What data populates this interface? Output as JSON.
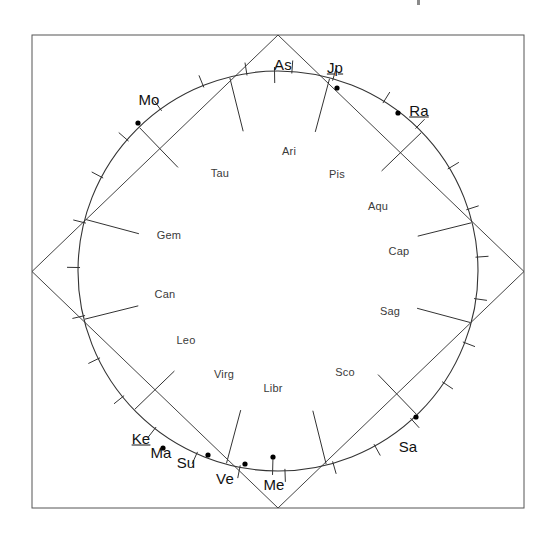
{
  "chart_data": {
    "type": "scatter",
    "title": "",
    "subtitle": "",
    "layout": {
      "frame": {
        "x": 32,
        "y": 35,
        "width": 492,
        "height": 473
      },
      "circle_center": {
        "x": 278,
        "y": 271
      },
      "circle_radius": 200,
      "grid": false,
      "legend": false,
      "axis_ranges": {
        "angle_degrees": [
          0,
          360
        ]
      }
    },
    "zodiac_signs": [
      {
        "label": "Ari",
        "x": 289,
        "y": 151
      },
      {
        "label": "Tau",
        "x": 220,
        "y": 173
      },
      {
        "label": "Gem",
        "x": 169,
        "y": 235
      },
      {
        "label": "Can",
        "x": 165,
        "y": 294
      },
      {
        "label": "Leo",
        "x": 186,
        "y": 340
      },
      {
        "label": "Virg",
        "x": 224,
        "y": 374
      },
      {
        "label": "Libr",
        "x": 273,
        "y": 388
      },
      {
        "label": "Sco",
        "x": 345,
        "y": 372
      },
      {
        "label": "Sag",
        "x": 390,
        "y": 311
      },
      {
        "label": "Cap",
        "x": 399,
        "y": 251
      },
      {
        "label": "Aqu",
        "x": 378,
        "y": 206
      },
      {
        "label": "Pis",
        "x": 337,
        "y": 174
      }
    ],
    "planets": [
      {
        "name": "As",
        "label": "As",
        "underlined": false,
        "label_x": 283,
        "label_y": 64,
        "dot": false,
        "angle_deg": 91,
        "tick": true
      },
      {
        "name": "Jp",
        "label": "Jp",
        "underlined": true,
        "label_x": 335,
        "label_y": 67,
        "dot": true,
        "dot_x": 337,
        "dot_y": 88,
        "tick": false
      },
      {
        "name": "Ra",
        "label": "Ra",
        "underlined": true,
        "label_x": 419,
        "label_y": 110,
        "dot": true,
        "dot_x": 398,
        "dot_y": 113,
        "tick": false
      },
      {
        "name": "Mo",
        "label": "Mo",
        "underlined": false,
        "label_x": 149,
        "label_y": 99,
        "dot": true,
        "dot_x": 138,
        "dot_y": 123,
        "tick": false
      },
      {
        "name": "Ke",
        "label": "Ke",
        "underlined": true,
        "label_x": 141,
        "label_y": 438,
        "dot": true,
        "dot_x": 163,
        "dot_y": 448,
        "tick": false
      },
      {
        "name": "Ma",
        "label": "Ma",
        "underlined": false,
        "label_x": 161,
        "label_y": 452,
        "dot": false,
        "tick": false
      },
      {
        "name": "Su",
        "label": "Su",
        "underlined": false,
        "label_x": 186,
        "label_y": 462,
        "dot": true,
        "dot_x": 208,
        "dot_y": 455,
        "tick": false
      },
      {
        "name": "Ve",
        "label": "Ve",
        "underlined": false,
        "label_x": 225,
        "label_y": 478,
        "dot": true,
        "dot_x": 245,
        "dot_y": 464,
        "tick": false
      },
      {
        "name": "Me",
        "label": "Me",
        "underlined": false,
        "label_x": 274,
        "label_y": 484,
        "dot": true,
        "dot_x": 273,
        "dot_y": 457,
        "tick": true
      },
      {
        "name": "Sa",
        "label": "Sa",
        "underlined": false,
        "label_x": 408,
        "label_y": 446,
        "dot": true,
        "dot_x": 416,
        "dot_y": 417,
        "tick": false
      }
    ],
    "tick_angles_deg": [
      4,
      18,
      31,
      46,
      58,
      74,
      86,
      99,
      112,
      126,
      139,
      152,
      166,
      179,
      193,
      206,
      219,
      232,
      246,
      259,
      272,
      286,
      299,
      312,
      326,
      339,
      352
    ],
    "cusp_angles_deg": [
      14,
      44,
      75,
      104,
      134,
      165,
      194,
      224,
      255,
      284,
      314,
      345
    ]
  },
  "colors": {
    "frame_stroke": "#555555",
    "diamond_stroke": "#444444",
    "circle_stroke": "#333333",
    "tick_stroke": "#333333",
    "dot_fill": "#000000",
    "sign_text": "#3a3a3a",
    "planet_text": "#111111",
    "background": "#ffffff"
  }
}
